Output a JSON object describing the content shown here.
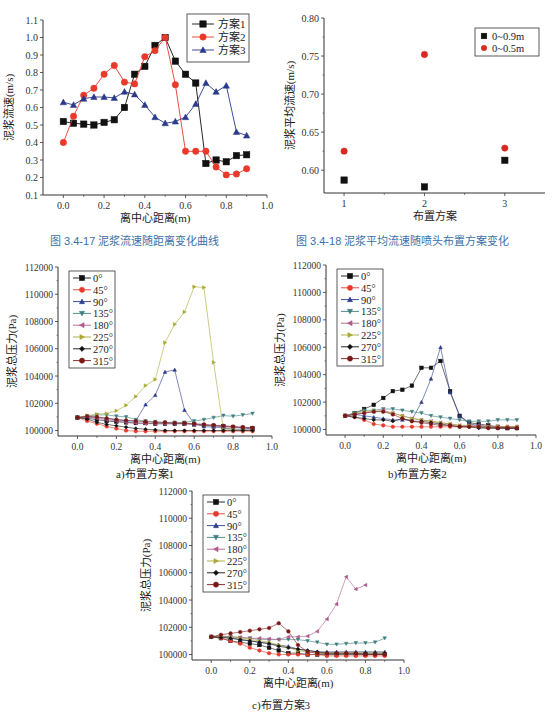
{
  "captions": {
    "fig17": "图 3.4-17   泥浆流速随距离变化曲线",
    "fig18": "图 3.4-18   泥浆平均流速随喷头布置方案变化",
    "sub_a": "a)布置方案1",
    "sub_b": "b)布置方案2",
    "sub_c": "c)布置方案3"
  },
  "chart_data": [
    {
      "id": "fig17",
      "type": "line",
      "title": "泥浆流速随距离变化曲线",
      "xlabel": "离中心距离(m)",
      "ylabel": "泥浆流速(m/s)",
      "xlim": [
        -0.1,
        1.0
      ],
      "ylim": [
        0.1,
        1.1
      ],
      "xticks": [
        0.0,
        0.2,
        0.4,
        0.6,
        0.8,
        1.0
      ],
      "yticks": [
        0.1,
        0.2,
        0.3,
        0.4,
        0.5,
        0.6,
        0.7,
        0.8,
        0.9,
        1.0,
        1.1
      ],
      "legend_position": "upper right",
      "x": [
        0.0,
        0.05,
        0.1,
        0.15,
        0.2,
        0.25,
        0.3,
        0.35,
        0.4,
        0.45,
        0.5,
        0.55,
        0.6,
        0.65,
        0.7,
        0.75,
        0.8,
        0.85,
        0.9
      ],
      "series": [
        {
          "name": "方案1",
          "color": "#111111",
          "marker": "square",
          "values": [
            0.52,
            0.51,
            0.505,
            0.5,
            0.515,
            0.53,
            0.6,
            0.79,
            0.835,
            0.955,
            1.0,
            0.865,
            0.79,
            0.74,
            0.28,
            0.3,
            0.29,
            0.325,
            0.33
          ]
        },
        {
          "name": "方案2",
          "color": "#e8392b",
          "marker": "circle",
          "values": [
            0.4,
            0.55,
            0.67,
            0.71,
            0.79,
            0.84,
            0.745,
            0.735,
            0.89,
            0.925,
            1.0,
            0.73,
            0.35,
            0.35,
            0.35,
            0.26,
            0.215,
            0.22,
            0.25
          ]
        },
        {
          "name": "方案3",
          "color": "#2a3a8a",
          "marker": "triangle",
          "values": [
            0.63,
            0.615,
            0.65,
            0.66,
            0.66,
            0.655,
            0.69,
            0.675,
            0.615,
            0.545,
            0.51,
            0.52,
            0.545,
            0.62,
            0.74,
            0.69,
            0.725,
            0.46,
            0.44
          ]
        }
      ]
    },
    {
      "id": "fig18",
      "type": "scatter",
      "title": "泥浆平均流速随喷头布置方案变化",
      "xlabel": "布置方案",
      "ylabel": "泥浆平均流速(m/s)",
      "xlim": [
        0.75,
        3.5
      ],
      "ylim": [
        0.57,
        0.8
      ],
      "xticks": [
        1,
        2,
        3
      ],
      "yticks": [
        0.6,
        0.65,
        0.7,
        0.75,
        0.8
      ],
      "legend_position": "upper right",
      "categories": [
        1,
        2,
        3
      ],
      "series": [
        {
          "name": "0~0.9m",
          "color": "#111111",
          "marker": "square",
          "values": [
            0.587,
            0.578,
            0.613
          ]
        },
        {
          "name": "0~0.5m",
          "color": "#d62a20",
          "marker": "circle",
          "values": [
            0.625,
            0.752,
            0.629
          ]
        }
      ]
    },
    {
      "id": "fig_a",
      "type": "line",
      "title": "a)布置方案1",
      "xlabel": "离中心距离(m)",
      "ylabel": "泥浆总压力(Pa)",
      "xlim": [
        -0.1,
        1.0
      ],
      "ylim": [
        99600,
        112000
      ],
      "xticks": [
        0.0,
        0.2,
        0.4,
        0.6,
        0.8,
        1.0
      ],
      "yticks": [
        100000,
        102000,
        104000,
        106000,
        108000,
        110000,
        112000
      ],
      "legend_position": "upper left",
      "x": [
        0.0,
        0.05,
        0.1,
        0.15,
        0.2,
        0.25,
        0.3,
        0.35,
        0.4,
        0.45,
        0.5,
        0.55,
        0.6,
        0.65,
        0.7,
        0.75,
        0.8,
        0.85,
        0.9
      ],
      "series": [
        {
          "name": "0°",
          "color": "#111111",
          "marker": "square",
          "values": [
            100950,
            100900,
            100800,
            100700,
            100650,
            100600,
            100550,
            100550,
            100500,
            100500,
            100500,
            100500,
            100450,
            100400,
            100350,
            100300,
            100250,
            100200,
            100150
          ]
        },
        {
          "name": "45°",
          "color": "#e8392b",
          "marker": "circle",
          "values": [
            100950,
            100700,
            100500,
            100300,
            100150,
            100000,
            99950,
            99950,
            99950,
            99950,
            99950,
            99950,
            99950,
            99950,
            99950,
            99950,
            99950,
            99950,
            99950
          ]
        },
        {
          "name": "90°",
          "color": "#2a3a8a",
          "marker": "triangle",
          "values": [
            100950,
            101000,
            100950,
            100900,
            100800,
            100700,
            100700,
            101900,
            102600,
            104300,
            104450,
            101500,
            100500,
            100300,
            100250,
            100200,
            100100,
            100100,
            100100
          ]
        },
        {
          "name": "135°",
          "color": "#3f7f7f",
          "marker": "triangle-down",
          "values": [
            100950,
            101050,
            101150,
            101150,
            101050,
            101000,
            100800,
            100700,
            100650,
            100600,
            100600,
            100600,
            100700,
            100800,
            100950,
            101100,
            101050,
            101150,
            101250
          ]
        },
        {
          "name": "180°",
          "color": "#b05a8a",
          "marker": "triangle-left",
          "values": [
            100950,
            101000,
            100900,
            100800,
            100700,
            100600,
            100550,
            100500,
            100500,
            100500,
            100500,
            100500,
            100450,
            100400,
            100350,
            100300,
            100250,
            100200,
            100150
          ]
        },
        {
          "name": "225°",
          "color": "#a8a832",
          "marker": "triangle-right",
          "values": [
            100950,
            101100,
            101200,
            101250,
            101450,
            101850,
            102500,
            103300,
            103750,
            106450,
            107800,
            108700,
            110550,
            110500,
            105000,
            100100,
            100050,
            100000,
            100000
          ]
        },
        {
          "name": "270°",
          "color": "#111111",
          "marker": "diamond",
          "values": [
            100950,
            100850,
            100600,
            100450,
            100350,
            100250,
            100150,
            100100,
            100050,
            100000,
            100000,
            100000,
            100000,
            100000,
            100000,
            100000,
            100000,
            100000,
            100000
          ]
        },
        {
          "name": "315°",
          "color": "#7a1818",
          "marker": "hexagon",
          "values": [
            100950,
            101050,
            101000,
            100900,
            100800,
            100750,
            100700,
            100650,
            100600,
            100600,
            100550,
            100550,
            100500,
            100450,
            100400,
            100350,
            100300,
            100250,
            100200
          ]
        }
      ]
    },
    {
      "id": "fig_b",
      "type": "line",
      "title": "b)布置方案2",
      "xlabel": "离中心距离(m)",
      "ylabel": "泥浆总压力(Pa)",
      "xlim": [
        -0.1,
        1.0
      ],
      "ylim": [
        99600,
        112000
      ],
      "xticks": [
        0.0,
        0.2,
        0.4,
        0.6,
        0.8,
        1.0
      ],
      "yticks": [
        100000,
        102000,
        104000,
        106000,
        108000,
        110000,
        112000
      ],
      "legend_position": "upper left",
      "x": [
        0.0,
        0.05,
        0.1,
        0.15,
        0.2,
        0.25,
        0.3,
        0.35,
        0.4,
        0.45,
        0.5,
        0.55,
        0.6,
        0.65,
        0.7,
        0.75,
        0.8,
        0.85,
        0.9
      ],
      "series": [
        {
          "name": "0°",
          "color": "#111111",
          "marker": "square",
          "values": [
            101000,
            101200,
            101500,
            101800,
            102300,
            102800,
            102900,
            103200,
            104500,
            104500,
            105000,
            102800,
            101000,
            100500,
            100400,
            100300,
            100200,
            100100,
            100100
          ]
        },
        {
          "name": "45°",
          "color": "#e8392b",
          "marker": "circle",
          "values": [
            101000,
            100900,
            100700,
            100400,
            100300,
            100200,
            100200,
            100200,
            100200,
            100200,
            100200,
            100200,
            100200,
            100200,
            100200,
            100200,
            100200,
            100200,
            100200
          ]
        },
        {
          "name": "90°",
          "color": "#2a3a8a",
          "marker": "triangle",
          "values": [
            101000,
            101100,
            101000,
            100900,
            100800,
            100700,
            100700,
            100700,
            102000,
            103700,
            106000,
            102700,
            101000,
            100400,
            100300,
            100200,
            100100,
            100100,
            100100
          ]
        },
        {
          "name": "135°",
          "color": "#3f7f7f",
          "marker": "triangle-down",
          "values": [
            101000,
            101200,
            101400,
            101400,
            101500,
            101500,
            101400,
            101300,
            101200,
            101000,
            100900,
            100800,
            100700,
            100600,
            100600,
            100600,
            100700,
            100700,
            100700
          ]
        },
        {
          "name": "180°",
          "color": "#b05a8a",
          "marker": "triangle-left",
          "values": [
            101000,
            101100,
            101200,
            101300,
            101400,
            101200,
            101000,
            100800,
            100700,
            100600,
            100500,
            100400,
            100300,
            100300,
            100300,
            100200,
            100200,
            100200,
            100200
          ]
        },
        {
          "name": "225°",
          "color": "#a8a832",
          "marker": "triangle-right",
          "values": [
            101000,
            101150,
            101300,
            101350,
            101300,
            101200,
            101000,
            100800,
            100700,
            100600,
            100500,
            100400,
            100300,
            100300,
            100200,
            100200,
            100200,
            100200,
            100200
          ]
        },
        {
          "name": "270°",
          "color": "#111111",
          "marker": "diamond",
          "values": [
            101000,
            100900,
            100800,
            100700,
            100700,
            100600,
            100800,
            100600,
            100600,
            100500,
            100400,
            100300,
            100200,
            100200,
            100100,
            100100,
            100100,
            100100,
            100100
          ]
        },
        {
          "name": "315°",
          "color": "#7a1818",
          "marker": "hexagon",
          "values": [
            101000,
            101100,
            101200,
            101300,
            101300,
            101100,
            100800,
            100600,
            100500,
            100400,
            100300,
            100300,
            100200,
            100200,
            100200,
            100100,
            100100,
            100100,
            100100
          ]
        }
      ]
    },
    {
      "id": "fig_c",
      "type": "line",
      "title": "c)布置方案3",
      "xlabel": "离中心距离(m)",
      "ylabel": "泥浆总压力(Pa)",
      "xlim": [
        -0.1,
        1.0
      ],
      "ylim": [
        99600,
        112000
      ],
      "xticks": [
        0.0,
        0.2,
        0.4,
        0.6,
        0.8,
        1.0
      ],
      "yticks": [
        100000,
        102000,
        104000,
        106000,
        108000,
        110000,
        112000
      ],
      "legend_position": "upper left",
      "x": [
        0.0,
        0.05,
        0.1,
        0.15,
        0.2,
        0.25,
        0.3,
        0.35,
        0.4,
        0.45,
        0.5,
        0.55,
        0.6,
        0.65,
        0.7,
        0.75,
        0.8,
        0.85,
        0.9
      ],
      "series": [
        {
          "name": "0°",
          "color": "#111111",
          "marker": "square",
          "values": [
            101300,
            101200,
            101000,
            100900,
            100800,
            100700,
            100500,
            100300,
            100100,
            100100,
            100000,
            100000,
            100000,
            100000,
            100000,
            100000,
            100000,
            100000,
            100000
          ]
        },
        {
          "name": "45°",
          "color": "#e8392b",
          "marker": "circle",
          "values": [
            101300,
            101200,
            101000,
            100800,
            100500,
            100300,
            100100,
            100000,
            100000,
            100000,
            100000,
            100000,
            99900,
            99900,
            99900,
            99900,
            99900,
            99900,
            99900
          ]
        },
        {
          "name": "90°",
          "color": "#2a3a8a",
          "marker": "triangle",
          "values": [
            101300,
            101300,
            101200,
            101100,
            101000,
            100900,
            100800,
            100700,
            100600,
            100400,
            100300,
            100200,
            100200,
            100200,
            100200,
            100200,
            100200,
            100200,
            100200
          ]
        },
        {
          "name": "135°",
          "color": "#3f7f7f",
          "marker": "triangle-down",
          "values": [
            101300,
            101350,
            101300,
            101250,
            101200,
            101100,
            101100,
            101100,
            101100,
            101100,
            101000,
            100900,
            100750,
            100750,
            100800,
            100850,
            100850,
            100900,
            101200
          ]
        },
        {
          "name": "180°",
          "color": "#b05a8a",
          "marker": "triangle-left",
          "values": [
            101300,
            101350,
            101300,
            101250,
            101200,
            101200,
            101150,
            101100,
            101300,
            101300,
            101350,
            101700,
            102600,
            103700,
            105700,
            104800,
            105100,
            null,
            null
          ]
        },
        {
          "name": "225°",
          "color": "#a8a832",
          "marker": "triangle-right",
          "values": [
            101300,
            101300,
            101250,
            101200,
            101100,
            101000,
            100900,
            100700,
            100500,
            100300,
            100200,
            100100,
            100100,
            100100,
            100100,
            100100,
            100100,
            100100,
            100100
          ]
        },
        {
          "name": "270°",
          "color": "#111111",
          "marker": "diamond",
          "values": [
            101300,
            101250,
            101200,
            101100,
            101000,
            100900,
            100800,
            100600,
            100500,
            100400,
            100300,
            100200,
            100100,
            100100,
            100100,
            100100,
            100100,
            100100,
            100100
          ]
        },
        {
          "name": "315°",
          "color": "#7a1818",
          "marker": "hexagon",
          "values": [
            101300,
            101450,
            101550,
            101650,
            101750,
            101850,
            101950,
            102300,
            101700,
            100700,
            100200,
            100100,
            100100,
            100100,
            100100,
            100100,
            100000,
            100000,
            100000
          ]
        }
      ]
    }
  ],
  "layout": {
    "fig17": {
      "left": 43,
      "right": 267,
      "top": 20,
      "bottom": 195
    },
    "fig18": {
      "left": 324,
      "right": 545,
      "top": 18,
      "bottom": 193
    },
    "fig_a": {
      "left": 58,
      "right": 272,
      "top": 267,
      "bottom": 436
    },
    "fig_b": {
      "left": 326,
      "right": 536,
      "top": 265,
      "bottom": 435
    },
    "fig_c": {
      "left": 192,
      "right": 404,
      "top": 491,
      "bottom": 660
    }
  }
}
